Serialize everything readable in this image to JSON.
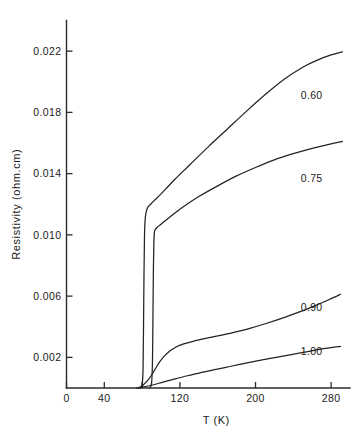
{
  "chart_data": {
    "type": "line",
    "title": "",
    "xlabel": "T (K)",
    "ylabel": "Resistivity (ohm.cm)",
    "xlim": [
      0,
      300
    ],
    "ylim": [
      0,
      0.024
    ],
    "grid": false,
    "legend_position": "inline-right-of-curve-ends",
    "xticks": [
      {
        "value": 0,
        "label": "0"
      },
      {
        "value": 40,
        "label": "40"
      },
      {
        "value": 80,
        "label": ""
      },
      {
        "value": 120,
        "label": "120"
      },
      {
        "value": 200,
        "label": "200"
      },
      {
        "value": 280,
        "label": "280"
      }
    ],
    "yticks": [
      {
        "value": 0.002,
        "label": "0.002"
      },
      {
        "value": 0.006,
        "label": "0.006"
      },
      {
        "value": 0.01,
        "label": "0.010"
      },
      {
        "value": 0.014,
        "label": "0.014"
      },
      {
        "value": 0.018,
        "label": "0.018"
      },
      {
        "value": 0.022,
        "label": "0.022"
      }
    ],
    "series": [
      {
        "name": "0.60",
        "label": "0.60",
        "label_x": 248,
        "label_y": 0.0189,
        "color": "#232323",
        "points": [
          [
            78,
            0.0
          ],
          [
            80,
            0.0002
          ],
          [
            81,
            0.0012
          ],
          [
            81.5,
            0.004
          ],
          [
            82,
            0.0074
          ],
          [
            82.5,
            0.0098
          ],
          [
            83,
            0.0108
          ],
          [
            84,
            0.0114
          ],
          [
            86,
            0.0118
          ],
          [
            89,
            0.012
          ],
          [
            93,
            0.01225
          ],
          [
            98,
            0.01255
          ],
          [
            105,
            0.013
          ],
          [
            115,
            0.01365
          ],
          [
            130,
            0.01455
          ],
          [
            150,
            0.01575
          ],
          [
            170,
            0.0169
          ],
          [
            190,
            0.01805
          ],
          [
            210,
            0.01915
          ],
          [
            230,
            0.02015
          ],
          [
            250,
            0.02095
          ],
          [
            265,
            0.0214
          ],
          [
            280,
            0.02175
          ],
          [
            292,
            0.02195
          ]
        ]
      },
      {
        "name": "0.75",
        "label": "0.75",
        "label_x": 248,
        "label_y": 0.01345,
        "color": "#232323",
        "points": [
          [
            88,
            0.0
          ],
          [
            90,
            0.0003
          ],
          [
            91,
            0.0018
          ],
          [
            91.5,
            0.0048
          ],
          [
            92,
            0.008
          ],
          [
            92.5,
            0.0096
          ],
          [
            93,
            0.01015
          ],
          [
            94,
            0.01035
          ],
          [
            96,
            0.0105
          ],
          [
            99,
            0.01065
          ],
          [
            104,
            0.0109
          ],
          [
            112,
            0.0113
          ],
          [
            124,
            0.01185
          ],
          [
            140,
            0.0125
          ],
          [
            160,
            0.0132
          ],
          [
            180,
            0.01385
          ],
          [
            200,
            0.0144
          ],
          [
            220,
            0.0149
          ],
          [
            240,
            0.0153
          ],
          [
            260,
            0.01565
          ],
          [
            280,
            0.01595
          ],
          [
            292,
            0.0161
          ]
        ]
      },
      {
        "name": "0.90",
        "label": "0.90",
        "label_x": 248,
        "label_y": 0.00505,
        "color": "#232323",
        "points": [
          [
            76,
            0.0
          ],
          [
            79,
            0.0001
          ],
          [
            82,
            0.00025
          ],
          [
            86,
            0.0005
          ],
          [
            90,
            0.00085
          ],
          [
            94,
            0.00125
          ],
          [
            98,
            0.00165
          ],
          [
            103,
            0.00205
          ],
          [
            109,
            0.0024
          ],
          [
            116,
            0.00268
          ],
          [
            124,
            0.00288
          ],
          [
            134,
            0.00305
          ],
          [
            146,
            0.00322
          ],
          [
            160,
            0.0034
          ],
          [
            176,
            0.00362
          ],
          [
            194,
            0.0039
          ],
          [
            212,
            0.00423
          ],
          [
            230,
            0.0046
          ],
          [
            248,
            0.005
          ],
          [
            264,
            0.0054
          ],
          [
            278,
            0.00578
          ],
          [
            290,
            0.00612
          ]
        ]
      },
      {
        "name": "1.00",
        "label": "1.00",
        "label_x": 248,
        "label_y": 0.00215,
        "color": "#232323",
        "points": [
          [
            74,
            0.0
          ],
          [
            80,
            5e-05
          ],
          [
            90,
            0.00018
          ],
          [
            102,
            0.00038
          ],
          [
            114,
            0.00058
          ],
          [
            128,
            0.0008
          ],
          [
            142,
            0.001
          ],
          [
            158,
            0.00122
          ],
          [
            174,
            0.00142
          ],
          [
            190,
            0.00162
          ],
          [
            206,
            0.00182
          ],
          [
            222,
            0.002
          ],
          [
            238,
            0.00218
          ],
          [
            252,
            0.00234
          ],
          [
            266,
            0.0025
          ],
          [
            278,
            0.00262
          ],
          [
            290,
            0.00272
          ]
        ]
      }
    ]
  }
}
